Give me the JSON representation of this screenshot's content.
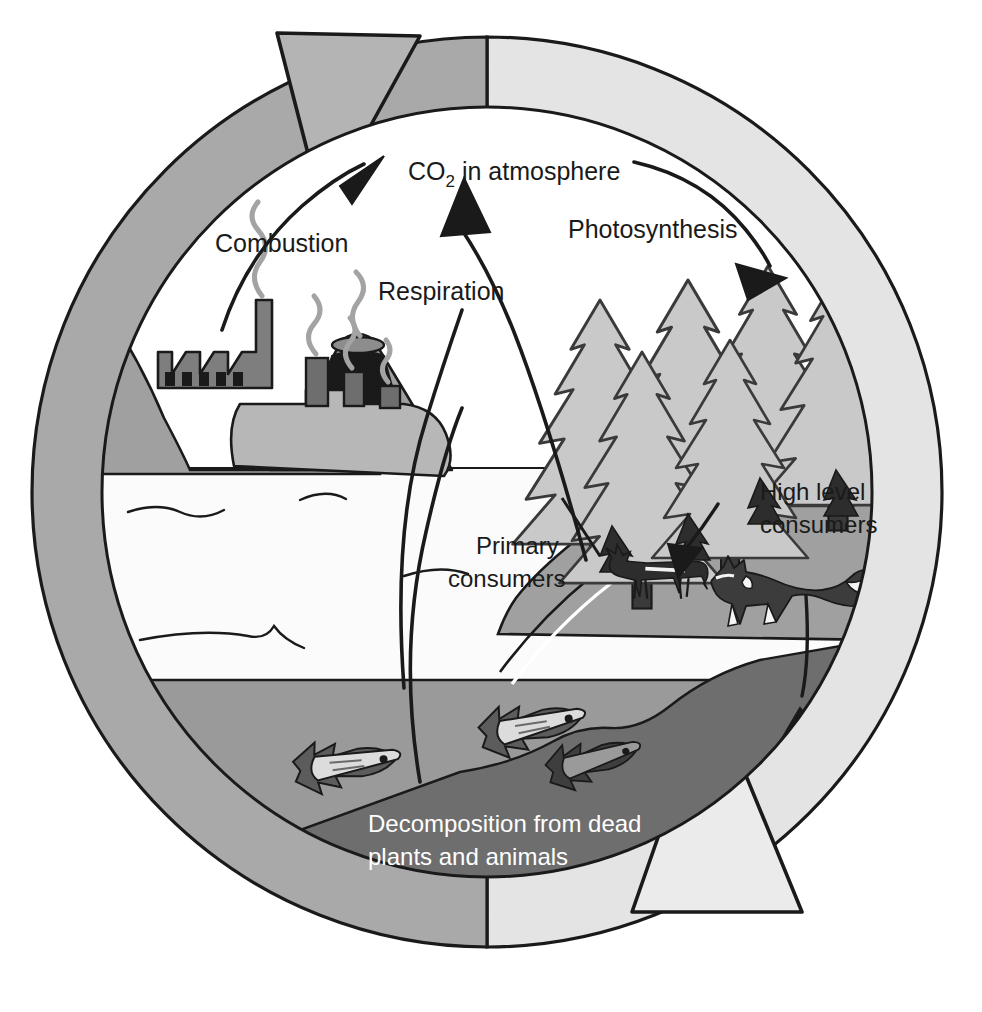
{
  "diagram": {
    "type": "cycle-diagram",
    "labels": {
      "co2_main": "CO",
      "co2_sub": "2",
      "co2_rest": " in atmosphere",
      "combustion": "Combustion",
      "respiration": "Respiration",
      "photosynthesis": "Photosynthesis",
      "high_level_consumers_line1": "High level",
      "high_level_consumers_line2": "consumers",
      "primary_consumers_line1": "Primary",
      "primary_consumers_line2": "consumers",
      "decomposition_line1": "Decomposition from dead",
      "decomposition_line2": "plants and animals"
    },
    "scene_elements": [
      "factory",
      "volcano",
      "ship",
      "conifer-forest",
      "deer",
      "fox",
      "fish",
      "ocean",
      "seabed",
      "land-hill"
    ],
    "arrows": [
      {
        "name": "combustion-arrow",
        "from": "factory-volcano-ship",
        "to": "co2-atmosphere"
      },
      {
        "name": "respiration-arrow",
        "from": "ocean-forest-seabed",
        "to": "co2-atmosphere"
      },
      {
        "name": "photosynthesis-arrow",
        "from": "co2-atmosphere",
        "to": "forest"
      },
      {
        "name": "primary-to-high-consumer-arrow",
        "from": "deer",
        "to": "fox"
      },
      {
        "name": "consumers-to-seabed-arrow",
        "from": "forest-consumers",
        "to": "seabed"
      },
      {
        "name": "outer-cycle-arrow-top",
        "direction": "clockwise"
      },
      {
        "name": "outer-cycle-arrow-bottom",
        "direction": "clockwise"
      }
    ],
    "colors": {
      "ring_dark": "#a9a9a9",
      "ring_light": "#e4e4e4",
      "outline": "#1a1a1a",
      "ocean_surface": "#fbfbfb",
      "ocean_deep": "#9a9a9a",
      "seabed": "#6e6e6e",
      "land": "#a0a0a0",
      "tree_fill": "#c9c9c9",
      "tree_trunk": "#3a3a3a",
      "sky": "#ffffff",
      "text_dark": "#1a1a1a",
      "text_light": "#ffffff"
    }
  }
}
